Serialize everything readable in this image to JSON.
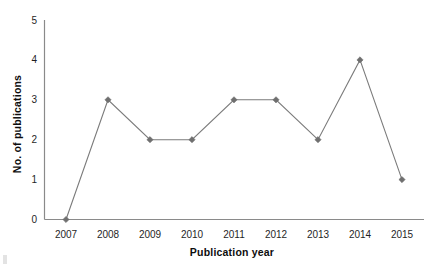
{
  "chart_data": {
    "type": "line",
    "title": "",
    "xlabel": "Publication year",
    "ylabel": "No. of publications",
    "categories": [
      "2007",
      "2008",
      "2009",
      "2010",
      "2011",
      "2012",
      "2013",
      "2014",
      "2015"
    ],
    "values": [
      0,
      3,
      2,
      2,
      3,
      3,
      2,
      4,
      1
    ],
    "series": [
      {
        "name": "No. of publications",
        "values": [
          0,
          3,
          2,
          2,
          3,
          3,
          2,
          4,
          1
        ]
      }
    ],
    "x_tick_labels": [
      "2007",
      "2008",
      "2009",
      "2010",
      "2011",
      "2012",
      "2013",
      "2014",
      "2015"
    ],
    "y_tick_labels": [
      "0",
      "1",
      "2",
      "3",
      "4",
      "5"
    ],
    "y_ticks": [
      0,
      1,
      2,
      3,
      4,
      5
    ],
    "ylim": [
      0,
      5
    ],
    "grid": false,
    "legend": false,
    "legend_position": "none",
    "marker": "diamond",
    "line_color": "#7b7b7b",
    "marker_color": "#6f6f6f",
    "axis_color": "#8a8a8a",
    "background_color": "#ffffff"
  }
}
